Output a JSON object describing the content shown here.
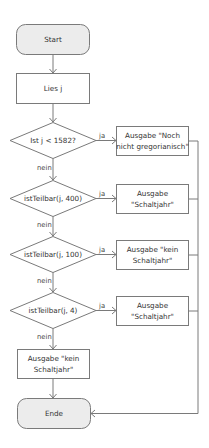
{
  "flowchart": {
    "start": {
      "label": "Start"
    },
    "read": {
      "label": "Lies j"
    },
    "decisions": [
      {
        "label": "Ist j < 1582?",
        "yes_label": "ja",
        "no_label": "nein",
        "output": [
          "Ausgabe \"Noch",
          "nicht gregorianisch\""
        ]
      },
      {
        "label": "istTeilbar(j, 400)",
        "yes_label": "ja",
        "no_label": "nein",
        "output": [
          "Ausgabe",
          "\"Schaltjahr\""
        ]
      },
      {
        "label": "istTeilbar(j, 100)",
        "yes_label": "ja",
        "no_label": "nein",
        "output": [
          "Ausgabe \"kein",
          "Schaltjahr\""
        ]
      },
      {
        "label": "istTeilbar(j, 4)",
        "yes_label": "ja",
        "no_label": "nein",
        "output": [
          "Ausgabe",
          "\"Schaltjahr\""
        ]
      }
    ],
    "final_output": [
      "Ausgabe \"kein",
      "Schaltjahr\""
    ],
    "end": {
      "label": "Ende"
    }
  }
}
